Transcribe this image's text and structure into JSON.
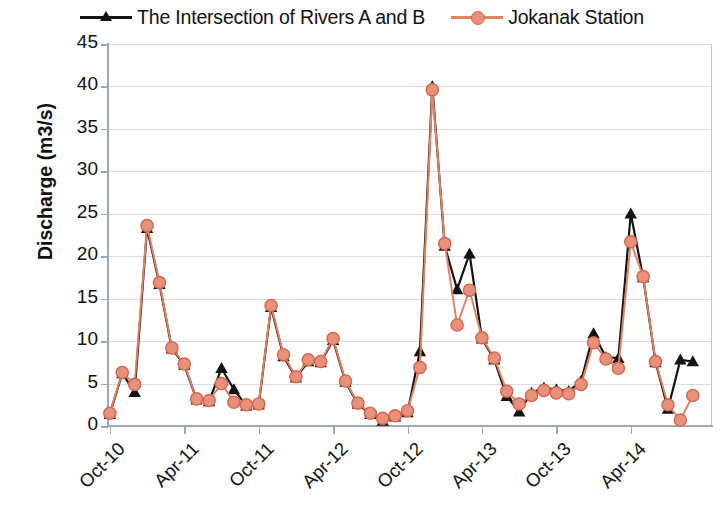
{
  "chart_data": {
    "type": "line",
    "title": "",
    "xlabel": "",
    "ylabel": "Discharge (m3/s)",
    "ylim": [
      0,
      45
    ],
    "yticks": [
      0,
      5,
      10,
      15,
      20,
      25,
      30,
      35,
      40,
      45
    ],
    "grid": true,
    "legend_position": "top-center",
    "x_tick_labels": [
      "Oct-10",
      "Apr-11",
      "Oct-11",
      "Apr-12",
      "Oct-12",
      "Apr-13",
      "Oct-13",
      "Apr-14"
    ],
    "x_tick_indices": [
      0,
      6,
      12,
      18,
      24,
      30,
      36,
      42
    ],
    "x": [
      "Oct-10",
      "Nov-10",
      "Dec-10",
      "Jan-11",
      "Feb-11",
      "Mar-11",
      "Apr-11",
      "May-11",
      "Jun-11",
      "Jul-11",
      "Aug-11",
      "Sep-11",
      "Oct-11",
      "Nov-11",
      "Dec-11",
      "Jan-12",
      "Feb-12",
      "Mar-12",
      "Apr-12",
      "May-12",
      "Jun-12",
      "Jul-12",
      "Aug-12",
      "Sep-12",
      "Oct-12",
      "Nov-12",
      "Dec-12",
      "Jan-13",
      "Feb-13",
      "Mar-13",
      "Apr-13",
      "May-13",
      "Jun-13",
      "Jul-13",
      "Aug-13",
      "Sep-13",
      "Oct-13",
      "Nov-13",
      "Dec-13",
      "Jan-14",
      "Feb-14",
      "Mar-14",
      "Apr-14",
      "May-14",
      "Jun-14",
      "Jul-14",
      "Aug-14",
      "Sep-14"
    ],
    "series": [
      {
        "name": "The Intersection of Rivers A and B",
        "color": "#141414",
        "marker": "triangle",
        "values": [
          1.4,
          6.2,
          4.0,
          23.3,
          16.7,
          9.1,
          7.2,
          3.1,
          2.9,
          6.8,
          4.3,
          2.4,
          2.5,
          14.0,
          8.2,
          5.7,
          7.6,
          7.5,
          10.1,
          5.2,
          2.6,
          1.4,
          0.6,
          1.1,
          1.6,
          8.8,
          40.0,
          21.2,
          16.1,
          20.3,
          10.3,
          7.8,
          3.5,
          1.7,
          3.9,
          4.5,
          4.3,
          4.1,
          5.3,
          10.9,
          8.1,
          8.0,
          25.0,
          17.5,
          7.5,
          2.0,
          7.8,
          7.6
        ]
      },
      {
        "name": "Jokanak Station",
        "color": "#E08266",
        "marker": "circle",
        "values": [
          1.5,
          6.3,
          4.9,
          23.6,
          16.9,
          9.2,
          7.3,
          3.2,
          3.0,
          5.0,
          2.8,
          2.5,
          2.6,
          14.2,
          8.4,
          5.8,
          7.8,
          7.6,
          10.3,
          5.3,
          2.7,
          1.5,
          0.9,
          1.2,
          1.8,
          6.9,
          39.6,
          21.5,
          11.9,
          16.0,
          10.4,
          8.0,
          4.1,
          2.6,
          3.6,
          4.2,
          3.9,
          3.8,
          4.9,
          9.8,
          7.9,
          6.8,
          21.7,
          17.6,
          7.6,
          2.5,
          0.7,
          3.6
        ]
      }
    ]
  },
  "legend": {
    "entries": [
      {
        "label": "The Intersection of Rivers A and B",
        "marker": "triangle-marker-icon",
        "color": "#141414"
      },
      {
        "label": "Jokanak Station",
        "marker": "circle-marker-icon",
        "color": "#E08266"
      }
    ]
  },
  "axes": {
    "y_title": "Discharge (m3/s)",
    "y_labels": [
      "45",
      "40",
      "35",
      "30",
      "25",
      "20",
      "15",
      "10",
      "5",
      "0"
    ],
    "x_labels": [
      "Oct-10",
      "Apr-11",
      "Oct-11",
      "Apr-12",
      "Oct-12",
      "Apr-13",
      "Oct-13",
      "Apr-14"
    ]
  },
  "colors": {
    "series_a": "#141414",
    "series_b": "#E08266",
    "gridline": "#d5dde6",
    "axis": "#9aa9b8",
    "background": "#ffffff"
  }
}
